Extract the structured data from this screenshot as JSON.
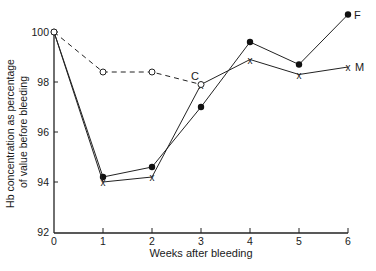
{
  "chart_data": {
    "type": "line",
    "title": "",
    "xlabel": "Weeks after bleeding",
    "ylabel": "Hb concentration as percentage of value before bleeding",
    "ylabel_lines": [
      "Hb concentration as percentage",
      "of value before bleeding"
    ],
    "x": [
      0,
      1,
      2,
      3,
      4,
      5,
      6
    ],
    "x_ticks": [
      "0",
      "1",
      "2",
      "3",
      "4",
      "5",
      "6"
    ],
    "y_ticks": [
      "92",
      "94",
      "96",
      "98",
      "100"
    ],
    "xlim": [
      0,
      6
    ],
    "ylim": [
      92,
      100
    ],
    "grid": false,
    "legend_position": "inline labels at series ends",
    "series": [
      {
        "name": "F",
        "label": "F",
        "marker": "filled-circle",
        "line": "solid",
        "x": [
          0,
          1,
          2,
          3,
          4,
          5,
          6
        ],
        "values": [
          100,
          94.2,
          94.6,
          97.0,
          99.6,
          98.7,
          100.7
        ]
      },
      {
        "name": "M",
        "label": "M",
        "marker": "x",
        "line": "solid",
        "x": [
          0,
          1,
          2,
          3,
          4,
          5,
          6
        ],
        "values": [
          100,
          94.0,
          94.2,
          97.9,
          98.9,
          98.3,
          98.6
        ]
      },
      {
        "name": "C",
        "label": "C",
        "marker": "open-circle",
        "line": "dashed",
        "x": [
          0,
          1,
          2,
          3
        ],
        "values": [
          100,
          98.4,
          98.4,
          97.9
        ]
      }
    ]
  }
}
